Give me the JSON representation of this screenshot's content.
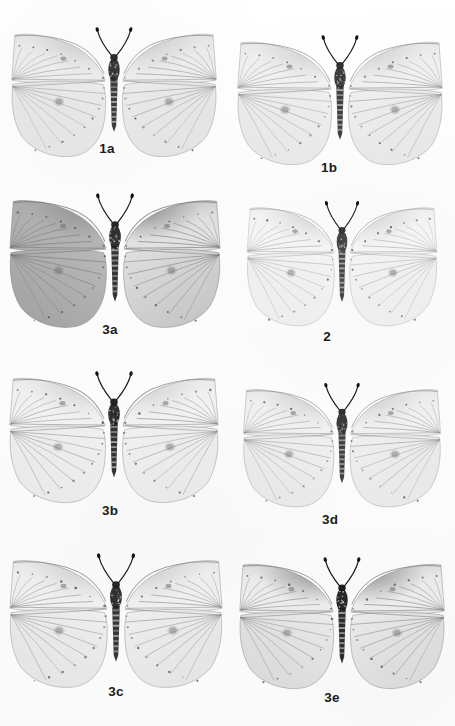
{
  "plate": {
    "kind": "taxonomic-specimen-plate",
    "subject": "butterfly-specimens",
    "background_color": "#fdfdfd",
    "ink_color": "#1b1b1b",
    "rows": 4,
    "columns": 2,
    "width": 455,
    "height": 726
  },
  "specimens": [
    {
      "label": "1a",
      "label_x": 107,
      "label_y": 141,
      "cell": {
        "x": 4,
        "y": 22,
        "w": 220,
        "h": 140
      },
      "wing_tone": "#e9e9e9",
      "shade_tone": "#d2d2d2",
      "vein_tone": "#8f8f8f",
      "body_tone": "#262626",
      "forewing_shade": 0.22,
      "hindwing_shade": 0.1,
      "left_hind_darker": false,
      "apex_dark": false,
      "discal_spot": true
    },
    {
      "label": "1b",
      "label_x": 329,
      "label_y": 160,
      "cell": {
        "x": 230,
        "y": 30,
        "w": 220,
        "h": 140
      },
      "wing_tone": "#ededed",
      "shade_tone": "#d8d8d8",
      "vein_tone": "#949494",
      "body_tone": "#2b2b2b",
      "forewing_shade": 0.16,
      "hindwing_shade": 0.12,
      "left_hind_darker": false,
      "apex_dark": false,
      "discal_spot": true
    },
    {
      "label": "3a",
      "label_x": 110,
      "label_y": 322,
      "cell": {
        "x": 2,
        "y": 188,
        "w": 226,
        "h": 145
      },
      "wing_tone": "#dcdcdc",
      "shade_tone": "#b4b4b4",
      "vein_tone": "#767676",
      "body_tone": "#1e1e1e",
      "forewing_shade": 0.4,
      "hindwing_shade": 0.34,
      "left_hind_darker": true,
      "apex_dark": true,
      "discal_spot": true
    },
    {
      "label": "2",
      "label_x": 327,
      "label_y": 329,
      "cell": {
        "x": 240,
        "y": 196,
        "w": 204,
        "h": 135
      },
      "wing_tone": "#f3f3f3",
      "shade_tone": "#e2e2e2",
      "vein_tone": "#a6a6a6",
      "body_tone": "#343434",
      "forewing_shade": 0.08,
      "hindwing_shade": 0.06,
      "left_hind_darker": false,
      "apex_dark": false,
      "discal_spot": true
    },
    {
      "label": "3b",
      "label_x": 110,
      "label_y": 503,
      "cell": {
        "x": 2,
        "y": 366,
        "w": 224,
        "h": 142
      },
      "wing_tone": "#efefef",
      "shade_tone": "#dcdcdc",
      "vein_tone": "#8a8a8a",
      "body_tone": "#1c1c1c",
      "forewing_shade": 0.14,
      "hindwing_shade": 0.08,
      "left_hind_darker": false,
      "apex_dark": false,
      "discal_spot": true
    },
    {
      "label": "3d",
      "label_x": 330,
      "label_y": 512,
      "cell": {
        "x": 236,
        "y": 378,
        "w": 212,
        "h": 134
      },
      "wing_tone": "#eeeeee",
      "shade_tone": "#dadada",
      "vein_tone": "#939393",
      "body_tone": "#2a2a2a",
      "forewing_shade": 0.17,
      "hindwing_shade": 0.11,
      "left_hind_darker": false,
      "apex_dark": false,
      "discal_spot": true
    },
    {
      "label": "3c",
      "label_x": 116,
      "label_y": 684,
      "cell": {
        "x": 2,
        "y": 548,
        "w": 228,
        "h": 145
      },
      "wing_tone": "#ededed",
      "shade_tone": "#d5d5d5",
      "vein_tone": "#8b8b8b",
      "body_tone": "#202020",
      "forewing_shade": 0.18,
      "hindwing_shade": 0.13,
      "left_hind_darker": false,
      "apex_dark": false,
      "discal_spot": true
    },
    {
      "label": "3e",
      "label_x": 332,
      "label_y": 690,
      "cell": {
        "x": 232,
        "y": 552,
        "w": 220,
        "h": 142
      },
      "wing_tone": "#e9e9e9",
      "shade_tone": "#c4c4c4",
      "vein_tone": "#7f7f7f",
      "body_tone": "#151515",
      "forewing_shade": 0.3,
      "hindwing_shade": 0.14,
      "left_hind_darker": false,
      "apex_dark": true,
      "discal_spot": true
    }
  ]
}
